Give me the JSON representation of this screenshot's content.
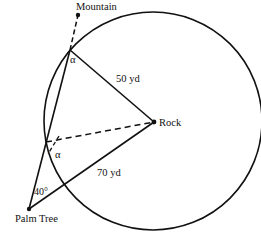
{
  "diagram": {
    "type": "geometry",
    "labels": {
      "mountain": "Mountain",
      "rock": "Rock",
      "palm_tree": "Palm Tree",
      "dist_rock_top": "50 yd",
      "dist_palm_rock": "70 yd",
      "angle_palm": "40°",
      "angle_alpha_top": "α",
      "angle_alpha_bottom": "α"
    },
    "points": {
      "mountain": [
        78,
        15
      ],
      "top_intersection": [
        70,
        50
      ],
      "rock": [
        154,
        122
      ],
      "lower_point": [
        46,
        142
      ],
      "palm_tree": [
        29,
        209
      ]
    },
    "circle": {
      "center": [
        153,
        121
      ],
      "radius": 109
    },
    "colors": {
      "stroke": "#111111",
      "background": "#ffffff"
    }
  }
}
